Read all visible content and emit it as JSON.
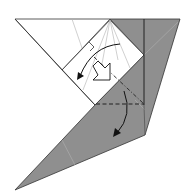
{
  "diagram": {
    "type": "origami-fold-step",
    "colors": {
      "paper_white": "#ffffff",
      "paper_colored": "#8f8f8f",
      "line": "#333333",
      "crease": "#b0b0b0",
      "arrow": "#111111"
    },
    "symbols": [
      {
        "name": "valley-fold-line",
        "style": "dashed"
      },
      {
        "name": "mountain-fold-line",
        "style": "dash-dot"
      },
      {
        "name": "fold-arrow-upper"
      },
      {
        "name": "fold-arrow-lower"
      },
      {
        "name": "push-arrow"
      },
      {
        "name": "right-angle-mark"
      }
    ]
  }
}
